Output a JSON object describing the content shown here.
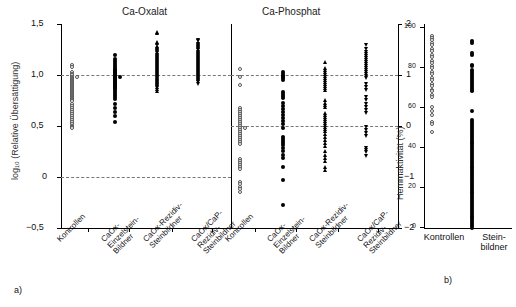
{
  "figure": {
    "panel_a_id": "a)",
    "panel_b_id": "b)"
  },
  "panels": {
    "a_left": {
      "title": "Ca-Oxalat"
    },
    "a_right": {
      "title": "Ca-Phosphat"
    },
    "b": {
      "title": ""
    }
  },
  "axes": {
    "left": {
      "label": "log₁₀ (Relative Übersättigung)",
      "ticks": [
        "1,5",
        "1,0",
        "0,5",
        "0",
        "−0,5"
      ]
    },
    "right": {
      "label": "",
      "ticks": [
        "2",
        "1",
        "0",
        "−1",
        "−2"
      ]
    },
    "b": {
      "label": "Hemmaktivität (%)",
      "ticks": [
        "100",
        "80",
        "60",
        "40",
        "20",
        "0"
      ]
    }
  },
  "categories": {
    "oxalat": [
      "Kontrollen",
      "CaOx-\nEinzelstein-\nBildner",
      "CaOx-Rezidiv-\nSteinbildner",
      "CaOx/CaP-\nRezidiv-\nSteinbildner"
    ],
    "phosphat": [
      "Kontrollen",
      "CaOx-\nEinzelstein-\nBildner",
      "CaOx-Rezidiv-\nSteinbildner",
      "CaOx/CaP-\nRezidiv-\nSteinbildner"
    ],
    "inhibition": [
      "Kontrollen",
      "Stein-\nbildner"
    ]
  },
  "markers": {
    "kontrollen": "open-circle",
    "einzelstein": "filled-circle",
    "rezidiv": "filled-triangle-up",
    "caox_cap": "filled-triangle-down",
    "steinbildner": "filled-circle"
  },
  "chart_data": [
    {
      "type": "scatter",
      "id": "ca-oxalat",
      "title": "Ca-Oxalat",
      "ylabel": "log10 (Relative Übersättigung)",
      "ylim": [
        -0.5,
        1.5
      ],
      "yticks": [
        -0.5,
        0,
        0.5,
        1.0,
        1.5
      ],
      "reference_lines": [
        1.0,
        0.0
      ],
      "grid": false,
      "legend": "none",
      "series": [
        {
          "name": "Kontrollen",
          "marker": "open-circle",
          "x": 1,
          "values": [
            1.12,
            1.1,
            1.05,
            1.03,
            1.02,
            1.0,
            1.0,
            0.99,
            0.98,
            0.97,
            0.96,
            0.95,
            0.94,
            0.93,
            0.92,
            0.91,
            0.9,
            0.89,
            0.88,
            0.87,
            0.86,
            0.85,
            0.84,
            0.83,
            0.82,
            0.81,
            0.8,
            0.79,
            0.78,
            0.77,
            0.76,
            0.74,
            0.72,
            0.7,
            0.68,
            0.66,
            0.64,
            0.62,
            0.6,
            0.58,
            0.56,
            0.54,
            0.52,
            0.51,
            0.5
          ]
        },
        {
          "name": "CaOx-Einzelstein-Bildner",
          "marker": "filled-circle",
          "x": 2,
          "values": [
            1.22,
            1.18,
            1.16,
            1.14,
            1.12,
            1.1,
            1.08,
            1.07,
            1.06,
            1.05,
            1.04,
            1.03,
            1.02,
            1.01,
            1.0,
            1.0,
            0.99,
            0.98,
            0.97,
            0.96,
            0.95,
            0.94,
            0.93,
            0.92,
            0.91,
            0.9,
            0.89,
            0.88,
            0.86,
            0.84,
            0.82,
            0.8,
            0.78,
            0.74,
            0.7,
            0.66,
            0.62,
            0.56
          ]
        },
        {
          "name": "CaOx-Rezidiv-Steinbildner",
          "marker": "filled-triangle-up",
          "x": 3,
          "values": [
            1.44,
            1.43,
            1.34,
            1.33,
            1.3,
            1.29,
            1.28,
            1.27,
            1.26,
            1.25,
            1.24,
            1.23,
            1.22,
            1.21,
            1.2,
            1.19,
            1.18,
            1.17,
            1.16,
            1.15,
            1.14,
            1.13,
            1.12,
            1.11,
            1.1,
            1.09,
            1.08,
            1.07,
            1.06,
            1.05,
            1.04,
            1.03,
            1.02,
            1.01,
            1.0,
            0.99,
            0.98,
            0.97,
            0.96,
            0.95,
            0.94,
            0.93,
            0.92,
            0.9,
            0.88,
            0.86
          ]
        },
        {
          "name": "CaOx/CaP-Rezidiv-Steinbildner",
          "marker": "filled-triangle-down",
          "x": 4,
          "values": [
            1.36,
            1.35,
            1.32,
            1.31,
            1.3,
            1.29,
            1.28,
            1.27,
            1.26,
            1.25,
            1.24,
            1.23,
            1.22,
            1.21,
            1.2,
            1.19,
            1.18,
            1.17,
            1.16,
            1.15,
            1.14,
            1.13,
            1.12,
            1.11,
            1.1,
            1.09,
            1.08,
            1.07,
            1.06,
            1.05,
            1.04,
            1.03,
            1.02,
            1.01,
            1.0,
            0.99,
            0.98,
            0.97,
            0.96,
            0.95,
            0.93
          ]
        }
      ]
    },
    {
      "type": "scatter",
      "id": "ca-phosphat",
      "title": "Ca-Phosphat",
      "ylabel": "",
      "ylim": [
        -2,
        2
      ],
      "yticks": [
        -2,
        -1,
        0,
        1,
        2
      ],
      "reference_lines": [
        1.0,
        0.0
      ],
      "grid": false,
      "legend": "none",
      "series": [
        {
          "name": "Kontrollen",
          "marker": "open-circle",
          "x": 1,
          "values": [
            1.15,
            1.0,
            0.85,
            0.4,
            0.36,
            0.32,
            0.28,
            0.24,
            0.2,
            0.16,
            0.12,
            0.08,
            0.04,
            0.0,
            0.0,
            -0.04,
            -0.08,
            -0.12,
            -0.16,
            -0.2,
            -0.24,
            -0.28,
            -0.32,
            -0.6,
            -0.64,
            -0.68,
            -0.72,
            -0.76,
            -0.8,
            -1.05,
            -1.1,
            -1.15,
            -1.2,
            -1.25
          ]
        },
        {
          "name": "CaOx-Einzelstein-Bildner",
          "marker": "filled-circle",
          "x": 2,
          "values": [
            1.1,
            1.06,
            1.02,
            1.0,
            0.98,
            0.94,
            0.7,
            0.66,
            0.62,
            0.58,
            0.5,
            0.44,
            0.38,
            0.32,
            0.26,
            0.2,
            0.14,
            0.08,
            0.0,
            -0.18,
            -0.22,
            -0.26,
            -0.3,
            -0.34,
            -0.4,
            -0.46,
            -0.52,
            -0.58,
            -0.76,
            -1.02,
            -1.5
          ]
        },
        {
          "name": "CaOx-Rezidiv-Steinbildner",
          "marker": "filled-triangle-up",
          "x": 3,
          "values": [
            1.3,
            1.18,
            1.14,
            1.1,
            1.06,
            1.02,
            0.98,
            0.94,
            0.9,
            0.86,
            0.82,
            0.78,
            0.74,
            0.55,
            0.5,
            0.46,
            0.42,
            0.3,
            0.26,
            0.22,
            0.18,
            0.14,
            0.1,
            0.06,
            0.02,
            -0.02,
            -0.06,
            -0.12,
            -0.18,
            -0.24,
            -0.3,
            -0.36,
            -0.46,
            -0.52,
            -0.58,
            -0.64,
            -0.76,
            -0.82
          ]
        },
        {
          "name": "CaOx/CaP-Rezidiv-Steinbildner",
          "marker": "filled-triangle-down",
          "x": 4,
          "values": [
            1.62,
            1.54,
            1.5,
            1.46,
            1.42,
            1.38,
            1.34,
            1.3,
            1.26,
            1.22,
            1.18,
            1.14,
            1.1,
            1.06,
            1.02,
            0.98,
            0.86,
            0.8,
            0.74,
            0.6,
            0.54,
            0.48,
            0.42,
            0.36,
            0.3,
            0.02,
            -0.04,
            -0.1,
            -0.16,
            -0.4,
            -0.44,
            -0.48,
            -0.54
          ]
        }
      ]
    },
    {
      "type": "scatter",
      "id": "hemmaktivitaet",
      "title": "",
      "ylabel": "Hemmaktivität (%)",
      "ylim": [
        0,
        105
      ],
      "yticks": [
        0,
        20,
        40,
        60,
        80,
        100
      ],
      "grid": false,
      "legend": "none",
      "series": [
        {
          "name": "Kontrollen",
          "marker": "open-circle",
          "x": 1,
          "values": [
            101,
            100,
            99,
            97,
            96,
            94,
            93,
            91,
            90,
            88,
            87,
            85,
            84,
            82,
            81,
            79,
            78,
            76,
            75,
            73,
            72,
            70,
            69,
            64,
            62,
            60,
            56,
            55,
            51
          ]
        },
        {
          "name": "Steinbildner",
          "marker": "filled-circle",
          "x": 2,
          "values": [
            98,
            97,
            92,
            91,
            86,
            85,
            83,
            82,
            81,
            80,
            79,
            78,
            77,
            76,
            75,
            74,
            73,
            72,
            62,
            57,
            56,
            55,
            54,
            53,
            52,
            51,
            50,
            49,
            48,
            47,
            46,
            45,
            44,
            43,
            42,
            41,
            40,
            39,
            38,
            37,
            36,
            35,
            34,
            33,
            32,
            31,
            30,
            29,
            28,
            27,
            26,
            25,
            24,
            23,
            22,
            21,
            20,
            19,
            18,
            17,
            16,
            15,
            14,
            13,
            12,
            11,
            10,
            9,
            8,
            7,
            6,
            5,
            4,
            3,
            2,
            1
          ]
        }
      ]
    }
  ]
}
